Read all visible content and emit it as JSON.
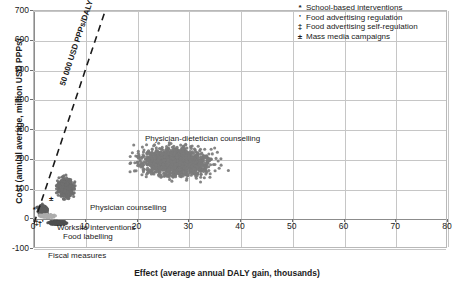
{
  "chart_data": {
    "type": "scatter",
    "title": "",
    "xlabel": "Effect (average annual DALY gain, thousands)",
    "ylabel": "Cost (annual average, million USD PPPs)",
    "xlim": [
      0,
      80
    ],
    "ylim": [
      -100,
      700
    ],
    "xticks": [
      "0",
      "10",
      "20",
      "30",
      "40",
      "50",
      "60",
      "70",
      "80"
    ],
    "yticks": [
      "-100",
      "0",
      "100",
      "200",
      "300",
      "400",
      "500",
      "600",
      "700"
    ],
    "grid": "both",
    "legend_position": "top-right",
    "marker_color": "#7b7b7b",
    "threshold": {
      "label": "50 000 USD PPPs/DALY",
      "style": "dashed",
      "color": "#1a1a1a",
      "from": [
        0,
        -20
      ],
      "to": [
        13.8,
        700
      ]
    },
    "clusters": [
      {
        "name": "Physician-dietetician counselling",
        "label": "Physician-dietetician counselling",
        "x_center": 27.5,
        "y_center": 190,
        "x_range": [
          14.5,
          41
        ],
        "y_range": [
          95,
          275
        ],
        "n_points": 1600,
        "color": "#7b7b7b"
      },
      {
        "name": "Physician counselling",
        "label": "Physician counselling",
        "x_center": 6.2,
        "y_center": 100,
        "x_range": [
          3.6,
          9.3
        ],
        "y_range": [
          40,
          152
        ],
        "n_points": 700,
        "color": "#6f6f6f"
      },
      {
        "name": "Worksite interventions",
        "label": "Worksite interventions",
        "x_center": 1.7,
        "y_center": 25,
        "x_range": [
          0.3,
          3.6
        ],
        "y_range": [
          0,
          60
        ],
        "n_points": 300,
        "color": "#5e5e5e"
      },
      {
        "name": "Food labelling",
        "label": "Food labelling",
        "x_center": 2.6,
        "y_center": 5,
        "x_range": [
          0.4,
          5.2
        ],
        "y_range": [
          -4,
          14
        ],
        "n_points": 220,
        "color": "#adadad"
      },
      {
        "name": "Fiscal measures",
        "label": "Fiscal measures",
        "x_center": 4.6,
        "y_center": -18,
        "x_range": [
          1.8,
          7.6
        ],
        "y_range": [
          -27,
          -8
        ],
        "n_points": 260,
        "color": "#4f4f4f"
      }
    ],
    "origin_markers": [
      {
        "symbol": "*",
        "x": 0.15,
        "y": 30
      },
      {
        "symbol": "±",
        "x": 3.3,
        "y": 68
      },
      {
        "symbol": "‡",
        "x": 0.5,
        "y": -12
      },
      {
        "symbol": "†",
        "x": 1.1,
        "y": -15
      },
      {
        "symbol": "'",
        "x": 1.9,
        "y": -11
      }
    ],
    "legend": [
      {
        "symbol": "*",
        "label": "School-based interventions"
      },
      {
        "symbol": "'",
        "label": "Food advertising regulation"
      },
      {
        "symbol": "‡",
        "label": "Food advertising self-regulation"
      },
      {
        "symbol": "±",
        "label": "Mass media campaigns"
      }
    ]
  }
}
